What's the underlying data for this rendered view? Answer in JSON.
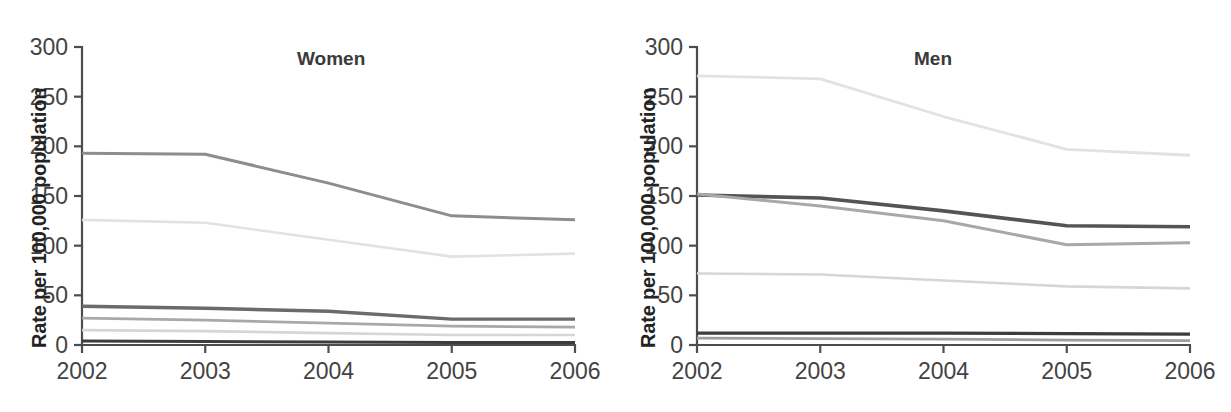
{
  "figure": {
    "background_color": "#ffffff",
    "width": 1231,
    "height": 412
  },
  "panels": [
    {
      "name": "women",
      "title": "Women",
      "ylabel": "Rate per 100,000 population",
      "y_ticks": [
        "0",
        "50",
        "100",
        "150",
        "200",
        "250",
        "300"
      ],
      "x_ticks": [
        "2002",
        "2003",
        "2004",
        "2005",
        "2006"
      ]
    },
    {
      "name": "men",
      "title": "Men",
      "ylabel": "Rate per 100,000 population",
      "y_ticks": [
        "0",
        "50",
        "100",
        "150",
        "200",
        "250",
        "300"
      ],
      "x_ticks": [
        "2002",
        "2003",
        "2004",
        "2005",
        "2006"
      ]
    }
  ],
  "colors": {
    "axis": "#4d4d4d",
    "tick_text": "#434343",
    "title_text": "#3a3a3a",
    "ylabel_text": "#232323",
    "series_dark": "#3c3c3c",
    "series_mid_dark": "#6b6b6b",
    "series_mid": "#8d8d8d",
    "series_mid_light": "#a8a8a8",
    "series_light": "#c9c9c9",
    "series_very_light": "#e2e2e2"
  },
  "chart_data": [
    {
      "type": "line",
      "title": "Women",
      "xlabel": "",
      "ylabel": "Rate per 100,000 population",
      "x": [
        2002,
        2003,
        2004,
        2005,
        2006
      ],
      "xlim": [
        2002,
        2006
      ],
      "ylim": [
        0,
        300
      ],
      "y_ticks": [
        0,
        50,
        100,
        150,
        200,
        250,
        300
      ],
      "grid": false,
      "legend": "none",
      "series": [
        {
          "name": "series-1",
          "color": "#8d8d8d",
          "width": 3.0,
          "values": [
            193,
            192,
            163,
            130,
            126
          ]
        },
        {
          "name": "series-2",
          "color": "#e2e2e2",
          "width": 2.6,
          "values": [
            126,
            123,
            106,
            89,
            92
          ]
        },
        {
          "name": "series-3",
          "color": "#6b6b6b",
          "width": 3.4,
          "values": [
            39,
            37,
            34,
            26,
            26
          ]
        },
        {
          "name": "series-4",
          "color": "#a8a8a8",
          "width": 2.8,
          "values": [
            27,
            25,
            22,
            19,
            18
          ]
        },
        {
          "name": "series-5",
          "color": "#d6d6d6",
          "width": 2.6,
          "values": [
            15,
            14,
            12,
            10,
            10
          ]
        },
        {
          "name": "series-6",
          "color": "#3c3c3c",
          "width": 3.0,
          "values": [
            4,
            3.5,
            3,
            2.5,
            2.5
          ]
        }
      ]
    },
    {
      "type": "line",
      "title": "Men",
      "xlabel": "",
      "ylabel": "Rate per 100,000 population",
      "x": [
        2002,
        2003,
        2004,
        2005,
        2006
      ],
      "xlim": [
        2002,
        2006
      ],
      "ylim": [
        0,
        300
      ],
      "y_ticks": [
        0,
        50,
        100,
        150,
        200,
        250,
        300
      ],
      "grid": false,
      "legend": "none",
      "series": [
        {
          "name": "series-1",
          "color": "#e2e2e2",
          "width": 2.8,
          "values": [
            271,
            268,
            230,
            197,
            191
          ]
        },
        {
          "name": "series-2",
          "color": "#545454",
          "width": 3.6,
          "values": [
            151,
            148,
            135,
            120,
            119
          ]
        },
        {
          "name": "series-3",
          "color": "#a8a8a8",
          "width": 3.0,
          "values": [
            152,
            140,
            125,
            101,
            103
          ]
        },
        {
          "name": "series-4",
          "color": "#d6d6d6",
          "width": 2.6,
          "values": [
            72,
            71,
            65,
            59,
            57
          ]
        },
        {
          "name": "series-5",
          "color": "#3c3c3c",
          "width": 3.2,
          "values": [
            12,
            12,
            12,
            11.5,
            11
          ]
        },
        {
          "name": "series-6",
          "color": "#9e9e9e",
          "width": 2.8,
          "values": [
            7,
            6.5,
            6,
            5,
            4.5
          ]
        }
      ]
    }
  ]
}
